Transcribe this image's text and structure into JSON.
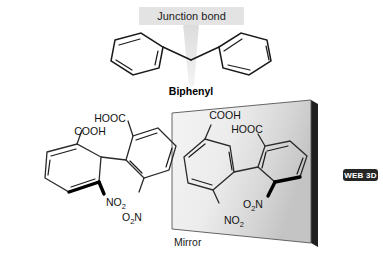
{
  "figure": {
    "background_color": "#ffffff",
    "callout": {
      "label": "Junction bond",
      "box_color": "#e3e3e3",
      "text_color": "#1a1a1a"
    },
    "biphenyl": {
      "caption": "Biphenyl"
    },
    "left_molecule": {
      "name": "left-enantiomer",
      "substituents": [
        {
          "id": "hooc-top",
          "label": "HOOC"
        },
        {
          "id": "cooh-left",
          "label": "COOH"
        },
        {
          "id": "no2-left",
          "label_main": "NO",
          "label_sub": "2"
        },
        {
          "id": "o2n-right",
          "label_pre": "O",
          "label_sub": "2",
          "label_post": "N"
        }
      ]
    },
    "mirror_panel": {
      "label": "Mirror",
      "fill_light": "#f2f2f2",
      "fill_dark": "#c9c9c9",
      "edge_color": "#1a1a1a",
      "molecule": {
        "name": "right-enantiomer",
        "substituents": [
          {
            "id": "cooh-top",
            "label": "COOH"
          },
          {
            "id": "hooc-right",
            "label": "HOOC"
          },
          {
            "id": "o2n-left",
            "label_pre": "O",
            "label_sub": "2",
            "label_post": "N"
          },
          {
            "id": "no2-bottom",
            "label_main": "NO",
            "label_sub": "2"
          }
        ]
      }
    },
    "web3d_badge": {
      "label": "WEB 3D",
      "background_color": "#262626",
      "text_color": "#ffffff"
    }
  }
}
